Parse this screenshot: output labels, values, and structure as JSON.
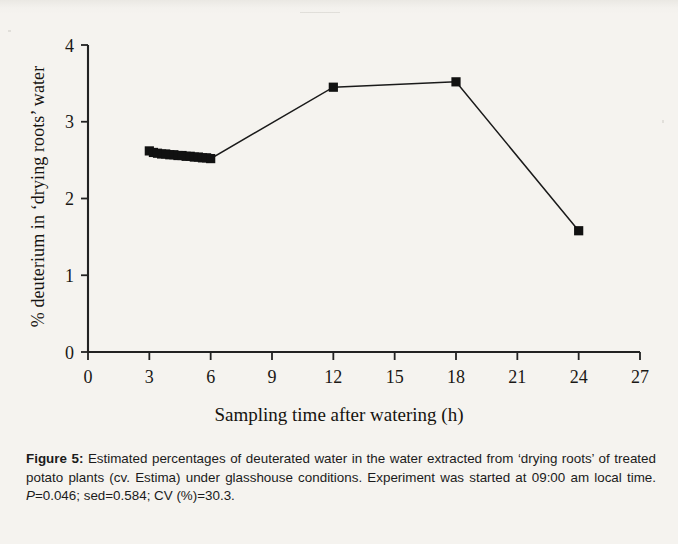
{
  "figure": {
    "caption_label": "Figure 5",
    "caption_sep": ":",
    "caption_part1": " Estimated percentages of deuterated water in the water extracted from ‘drying roots’ of treated potato plants (cv. Estima) under glasshouse conditions. Experiment was started at 09:00 am local time. ",
    "caption_stat_italic": "P",
    "caption_part2": "=0.046; sed=0.584; CV (%)=30.3."
  },
  "chart_data": {
    "type": "line",
    "title": "",
    "xlabel": "Sampling time after watering (h)",
    "ylabel": "% deuterium in ‘drying roots’ water",
    "xlim": [
      0,
      27
    ],
    "ylim": [
      0,
      4
    ],
    "xticks": [
      0,
      3,
      6,
      9,
      12,
      15,
      18,
      21,
      24,
      27
    ],
    "yticks": [
      0,
      1,
      2,
      3,
      4
    ],
    "xtick_labels": [
      "0",
      "3",
      "6",
      "9",
      "12",
      "15",
      "18",
      "21",
      "24",
      "27"
    ],
    "ytick_labels": [
      "0",
      "1",
      "2",
      "3",
      "4"
    ],
    "grid": false,
    "legend": false,
    "marker": "filled-square",
    "line_color": "#1a1a1a",
    "marker_color": "#111111",
    "series": [
      {
        "name": "% deuterium in drying roots' water",
        "x": [
          3.0,
          3.2,
          3.4,
          3.6,
          3.8,
          4.0,
          4.2,
          4.4,
          4.6,
          4.8,
          5.0,
          5.2,
          5.4,
          5.6,
          5.8,
          6.0,
          12.0,
          18.0,
          24.0
        ],
        "values": [
          2.62,
          2.6,
          2.59,
          2.58,
          2.58,
          2.57,
          2.57,
          2.56,
          2.56,
          2.55,
          2.55,
          2.54,
          2.54,
          2.53,
          2.53,
          2.52,
          3.45,
          3.52,
          1.58
        ]
      }
    ]
  },
  "axis": {
    "y_axis_name": "vertical-axis",
    "x_axis_name": "horizontal-axis"
  }
}
